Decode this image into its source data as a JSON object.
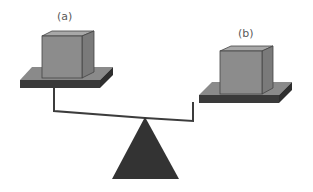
{
  "diagram": {
    "type": "balance-scale",
    "labels": {
      "left": "(a)",
      "right": "(b)"
    },
    "colors": {
      "background": "#ffffff",
      "cube_front": "#8c8c8c",
      "cube_top": "#a8a8a8",
      "cube_side": "#7a7a7a",
      "pan_top": "#8a8a8a",
      "pan_base": "#3a3a3a",
      "beam": "#3c3c3c",
      "fulcrum": "#333333",
      "label": "#5a5a5a"
    }
  }
}
